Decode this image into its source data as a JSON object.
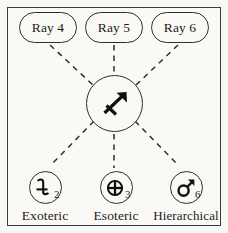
{
  "figure": {
    "background_color": "#faf9f6",
    "line_color": "#2e2e2e"
  },
  "center": {
    "name": "sagittarius-glyph",
    "symbol": "♐",
    "label": "Sagittarius"
  },
  "rays": [
    {
      "id": "ray-4",
      "label": "Ray 4"
    },
    {
      "id": "ray-5",
      "label": "Ray 5"
    },
    {
      "id": "ray-6",
      "label": "Ray 6"
    }
  ],
  "rulers": [
    {
      "id": "exoteric",
      "label": "Exoteric",
      "symbol": "♃",
      "symbol_name": "jupiter-glyph",
      "number": "2"
    },
    {
      "id": "esoteric",
      "label": "Esoteric",
      "symbol": "⊕",
      "symbol_name": "earth-glyph",
      "number": "3"
    },
    {
      "id": "hierarchical",
      "label": "Hierarchical",
      "symbol": "♂",
      "symbol_name": "mars-glyph",
      "number": "6"
    }
  ]
}
